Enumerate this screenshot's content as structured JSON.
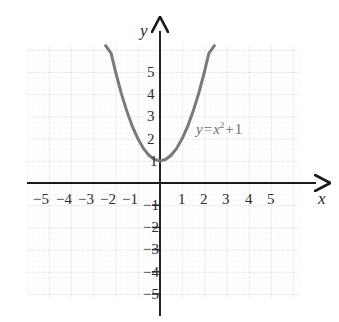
{
  "chart_data": {
    "type": "line",
    "title": "",
    "xlabel": "x",
    "ylabel": "y",
    "equation_label": "y = x² + 1",
    "function": "y = x^2 + 1",
    "xlim": [
      -5.9,
      5.9
    ],
    "ylim": [
      -5.9,
      5.9
    ],
    "grid": true,
    "grid_style": "dotted",
    "minor_grid_divisions": 4,
    "legend": "none",
    "x_ticks": [
      -5,
      -4,
      -3,
      -2,
      -1,
      1,
      2,
      3,
      4,
      5
    ],
    "y_ticks": [
      5,
      4,
      3,
      2,
      1,
      -1,
      -2,
      -3,
      -4,
      -5
    ],
    "x_tick_labels": [
      "−5",
      "−4",
      "−3",
      "−2",
      "−1",
      "1",
      "2",
      "3",
      "4",
      "5"
    ],
    "y_tick_labels": [
      "5",
      "4",
      "3",
      "2",
      "1",
      "−1",
      "−2",
      "−3",
      "−4",
      "−5"
    ],
    "vertex": [
      0,
      1
    ],
    "series": [
      {
        "name": "y = x² + 1",
        "x": [
          -2.45,
          -2.2,
          -2.0,
          -1.75,
          -1.5,
          -1.25,
          -1.0,
          -0.75,
          -0.5,
          -0.25,
          0,
          0.25,
          0.5,
          0.75,
          1.0,
          1.25,
          1.5,
          1.75,
          2.0,
          2.2,
          2.45
        ],
        "y": [
          7.0,
          5.84,
          5.0,
          4.06,
          3.25,
          2.56,
          2.0,
          1.56,
          1.25,
          1.06,
          1.0,
          1.06,
          1.25,
          1.56,
          2.0,
          2.56,
          3.25,
          4.06,
          5.0,
          5.84,
          7.0
        ]
      }
    ],
    "colors": {
      "curve": "#7a7a7a",
      "axis": "#1a1a1a",
      "grid_major": "#bfbfbf",
      "grid_minor": "#dcdcdc",
      "text": "#2b2b2b",
      "label": "#6e6e6e",
      "background": "#ffffff"
    }
  },
  "axes": {
    "x_axis_name": "x",
    "y_axis_name": "y"
  },
  "curve_label": {
    "lhs": "y",
    "equals": "=",
    "base": "x",
    "exponent": "2",
    "plus": "+",
    "constant": "1"
  }
}
